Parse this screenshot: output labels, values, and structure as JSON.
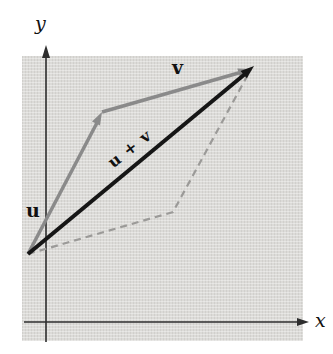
{
  "figure": {
    "labels": {
      "y_axis": "y",
      "x_axis": "x",
      "u": "u",
      "v": "v",
      "sum": "u + v"
    }
  },
  "colors": {
    "gray_vector": "#8a8a8a",
    "sum_vector": "#161616",
    "dashed_line": "#9b9a98",
    "axis": "#2e2e2e",
    "region_fill": "#dcdbd8",
    "label_text": "#111111"
  },
  "geometry": {
    "axes": {
      "y_line": {
        "x1": 46,
        "y1": 56,
        "x2": 46,
        "y2": 342
      },
      "y_arrow": "46,45 42,58 50,58",
      "x_line": {
        "x1": 24,
        "y1": 322,
        "x2": 298,
        "y2": 322
      },
      "x_arrow": "309,322 297,318 297,326"
    },
    "vectors": {
      "u": {
        "x1": 28,
        "y1": 254,
        "x2": 99,
        "y2": 119,
        "arrow": "102,112 92,121.4 100,125.6"
      },
      "v": {
        "x1": 102,
        "y1": 112,
        "x2": 242,
        "y2": 72,
        "arrow": "251,69 239.9,77 237.3,68.4"
      },
      "sum": {
        "x1": 28,
        "y1": 254,
        "x2": 245,
        "y2": 74,
        "arrow": "254,66 240.6,70.9 246.8,78.3"
      }
    },
    "dashed_points": "28,254 173,212 251,69",
    "dash_pattern": "7,5"
  }
}
